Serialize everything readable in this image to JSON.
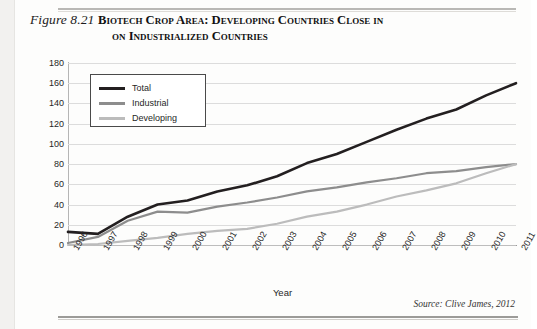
{
  "figure": {
    "number": "Figure 8.21",
    "title_line1": "Biotech Crop Area: Developing Countries Close in",
    "title_line2": "on Industrialized Countries",
    "source": "Source: Clive James, 2012"
  },
  "legend": {
    "position": "inside-top-left",
    "items": [
      {
        "label": "Total",
        "color": "#231f20"
      },
      {
        "label": "Industrial",
        "color": "#8d8d8d"
      },
      {
        "label": "Developing",
        "color": "#bcbcbc"
      }
    ]
  },
  "chart_data": {
    "type": "line",
    "xlabel": "Year",
    "ylabel": "Million Hectares",
    "ylim": [
      0,
      180
    ],
    "ytick_step": 20,
    "yticks": [
      180,
      160,
      140,
      120,
      100,
      80,
      60,
      40,
      20,
      0
    ],
    "grid": "horizontal",
    "categories": [
      "1996",
      "1997",
      "1998",
      "1999",
      "2000",
      "2001",
      "2002",
      "2003",
      "2004",
      "2005",
      "2006",
      "2007",
      "2008",
      "2009",
      "2010",
      "2011"
    ],
    "series": [
      {
        "name": "Total",
        "color": "#231f20",
        "values": [
          13,
          11,
          28,
          40,
          44,
          53,
          59,
          68,
          81,
          90,
          102,
          114,
          125,
          134,
          148,
          160
        ]
      },
      {
        "name": "Industrial",
        "color": "#8d8d8d",
        "values": [
          2,
          8,
          24,
          33,
          32,
          38,
          42,
          47,
          53,
          57,
          62,
          66,
          71,
          73,
          77,
          80
        ]
      },
      {
        "name": "Developing",
        "color": "#bcbcbc",
        "values": [
          0,
          1,
          4,
          7,
          11,
          14,
          16,
          21,
          28,
          33,
          40,
          48,
          54,
          61,
          71,
          80
        ]
      }
    ],
    "source": "Clive James, 2012"
  }
}
